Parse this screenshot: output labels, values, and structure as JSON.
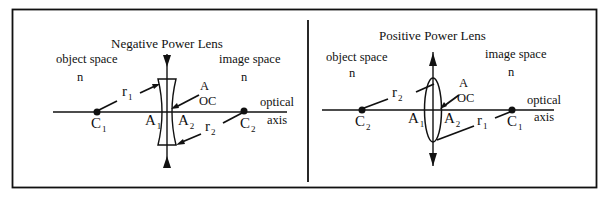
{
  "panels": [
    {
      "id": "negative",
      "title": "Negative Power Lens",
      "object_space": "object space",
      "image_space": "image space",
      "n_left": "n",
      "n_right": "n",
      "apex_label_A": "A",
      "apex_label_OC": "OC",
      "optical_axis_line1": "optical",
      "optical_axis_line2": "axis",
      "center_left": {
        "base": "C",
        "sub": "1"
      },
      "center_right": {
        "base": "C",
        "sub": "2"
      },
      "vertex_left": {
        "base": "A",
        "sub": "1"
      },
      "vertex_right": {
        "base": "A",
        "sub": "2"
      },
      "radius_upper": {
        "base": "r",
        "sub": "1"
      },
      "radius_lower": {
        "base": "r",
        "sub": "2"
      }
    },
    {
      "id": "positive",
      "title": "Positive Power Lens",
      "object_space": "object space",
      "image_space": "image space",
      "n_left": "n",
      "n_right": "n",
      "apex_label_A": "A",
      "apex_label_OC": "OC",
      "optical_axis_line1": "optical",
      "optical_axis_line2": "axis",
      "center_left": {
        "base": "C",
        "sub": "2"
      },
      "center_right": {
        "base": "C",
        "sub": "1"
      },
      "vertex_left": {
        "base": "A",
        "sub": "1"
      },
      "vertex_right": {
        "base": "A",
        "sub": "2"
      },
      "radius_upper": {
        "base": "r",
        "sub": "2"
      },
      "radius_lower": {
        "base": "r",
        "sub": "1"
      }
    }
  ],
  "colors": {
    "ink": "#111111",
    "background": "#ffffff"
  }
}
